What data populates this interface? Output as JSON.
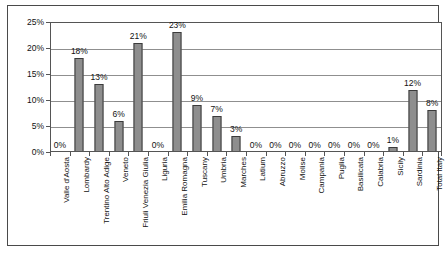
{
  "chart_data": {
    "type": "bar",
    "title": "",
    "subtitle": "",
    "xlabel": "",
    "ylabel": "",
    "ylim": [
      0,
      25
    ],
    "ytick_labels": [
      "0%",
      "5%",
      "10%",
      "15%",
      "20%",
      "25%"
    ],
    "ytick_values": [
      0,
      5,
      10,
      15,
      20,
      25
    ],
    "grid": true,
    "legend": "none",
    "categories": [
      "Valle d'Aosta",
      "Lombardy",
      "Trentino Alto Adige",
      "Veneto",
      "Friuli Venezia Giulia",
      "Liguria",
      "Emilia Romagna",
      "Tuscany",
      "Umbria",
      "Marches",
      "Latium",
      "Abruzzo",
      "Molise",
      "Campania",
      "Puglia",
      "Basilicata",
      "Calabria",
      "Sicily",
      "Sardinia",
      "Total Italy"
    ],
    "values": [
      0,
      18,
      13,
      6,
      21,
      0,
      23,
      9,
      7,
      3,
      0,
      0,
      0,
      0,
      0,
      0,
      0,
      1,
      12,
      8
    ],
    "data_labels": [
      "0%",
      "18%",
      "13%",
      "6%",
      "21%",
      "0%",
      "23%",
      "9%",
      "7%",
      "3%",
      "0%",
      "0%",
      "0%",
      "0%",
      "0%",
      "0%",
      "0%",
      "1%",
      "12%",
      "8%"
    ],
    "bar_color": "#8e8e8e",
    "bar_border_color": "#3b3b3b",
    "gridline_color": "#8f8f8f",
    "axis_color": "#555555",
    "frame_color": "#4a4a4a"
  }
}
